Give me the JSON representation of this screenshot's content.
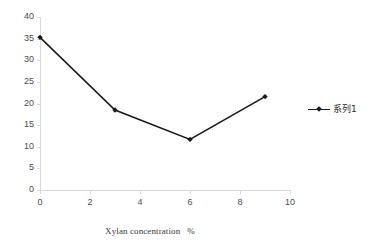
{
  "chart_data": {
    "type": "line",
    "title": "",
    "subtitle": "",
    "xlabel": "Xylan concentration   %",
    "ylabel": "",
    "xlim": [
      0,
      10
    ],
    "ylim": [
      0,
      40
    ],
    "x_ticks": [
      "0",
      "2",
      "4",
      "6",
      "8",
      "10"
    ],
    "x_tick_values": [
      0,
      2,
      4,
      6,
      8,
      10
    ],
    "y_ticks": [
      "0",
      "5",
      "10",
      "15",
      "20",
      "25",
      "30",
      "35",
      "40"
    ],
    "y_tick_values": [
      0,
      5,
      10,
      15,
      20,
      25,
      30,
      35,
      40
    ],
    "grid": false,
    "legend_position": "right",
    "series": [
      {
        "name": "系列1",
        "color": "#1a1a1a",
        "marker": "diamond",
        "x": [
          0,
          3,
          6,
          9
        ],
        "values": [
          35.3,
          18.5,
          11.7,
          21.6
        ]
      }
    ],
    "annotations": []
  },
  "axes": {
    "line_color": "#d9d9d9",
    "tick_label_color": "#4d4d4d",
    "axis_title_color": "#3a3a3a"
  },
  "legend": {
    "entries": [
      {
        "label": "系列1",
        "color": "#1a1a1a",
        "marker": "diamond"
      }
    ]
  },
  "background": {
    "plot_color": "#ffffff",
    "page_color": "#ffffff"
  }
}
